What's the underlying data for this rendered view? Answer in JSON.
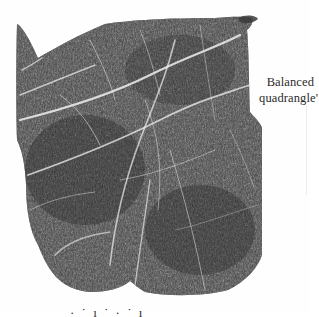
{
  "figure": {
    "ink_color": "#3a3a3a",
    "crease_color": "#e8e8e8",
    "background": "#fefefe"
  },
  "caption": {
    "line1": "Balanced",
    "line2": "quadrangle'"
  },
  "bottom_text": {
    "partial": "· ˙ ı ˙ · ˙ ı"
  }
}
